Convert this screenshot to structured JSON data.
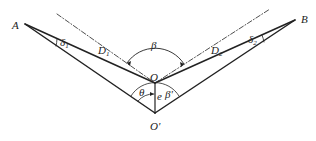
{
  "diagram": {
    "points": {
      "A": {
        "label": "A",
        "x": 25,
        "y": 24
      },
      "B": {
        "label": "B",
        "x": 295,
        "y": 20
      },
      "O": {
        "label": "O",
        "x": 155,
        "y": 83
      },
      "O_prime": {
        "label": "O'",
        "x": 155,
        "y": 113
      }
    },
    "labels": {
      "delta1": "δ",
      "delta1_sub": "1",
      "delta2": "δ",
      "delta2_sub": "2",
      "D1": "D",
      "D1_sub": "1",
      "D2": "D",
      "D2_sub": "2",
      "beta": "β",
      "theta": "θ",
      "e": "e",
      "beta_prime": "β'"
    },
    "colors": {
      "stroke": "#222222"
    }
  }
}
